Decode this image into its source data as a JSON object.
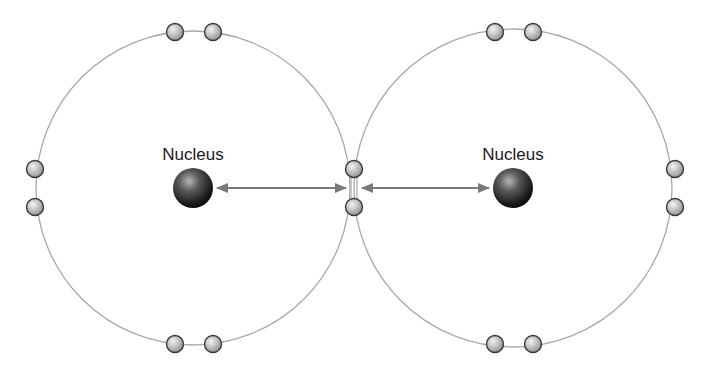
{
  "diagram": {
    "type": "covalent-bond-two-atoms",
    "atoms": [
      {
        "id": "left",
        "nucleus_label": "Nucleus",
        "center": [
          193,
          188
        ],
        "shell_radius": 157,
        "nucleus_radius": 20,
        "electrons": [
          [
            175,
            32
          ],
          [
            213,
            32
          ],
          [
            35,
            169
          ],
          [
            35,
            207
          ],
          [
            354,
            169
          ],
          [
            354,
            207
          ],
          [
            175,
            344
          ],
          [
            213,
            344
          ]
        ]
      },
      {
        "id": "right",
        "nucleus_label": "Nucleus",
        "center": [
          513,
          188
        ],
        "shell_radius": 159,
        "nucleus_radius": 20,
        "electrons": [
          [
            495,
            32
          ],
          [
            533,
            32
          ],
          [
            675,
            169
          ],
          [
            675,
            207
          ],
          [
            495,
            344
          ],
          [
            533,
            344
          ]
        ]
      }
    ],
    "arrows": [
      {
        "from": [
          217,
          188
        ],
        "to": [
          346,
          188
        ]
      },
      {
        "from": [
          362,
          188
        ],
        "to": [
          489,
          188
        ]
      }
    ],
    "colors": {
      "shell": "#a8a8a8",
      "arrow": "#7a7a7a",
      "electron_fill": "#bdbdbd",
      "electron_stroke": "#3a3a3a",
      "nucleus_dark": "#111111",
      "nucleus_light": "#9a9a9a",
      "label": "#1a1a1a"
    }
  }
}
